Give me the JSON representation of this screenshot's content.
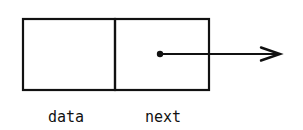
{
  "diagram": {
    "type": "linked-list-node",
    "node": {
      "fields": [
        {
          "name": "data",
          "label": "data",
          "content": ""
        },
        {
          "name": "next",
          "label": "next",
          "content": "pointer"
        }
      ]
    },
    "pointer": {
      "from": "next",
      "direction": "right",
      "target": ""
    },
    "colors": {
      "stroke": "#111111",
      "background": "#ffffff"
    }
  }
}
